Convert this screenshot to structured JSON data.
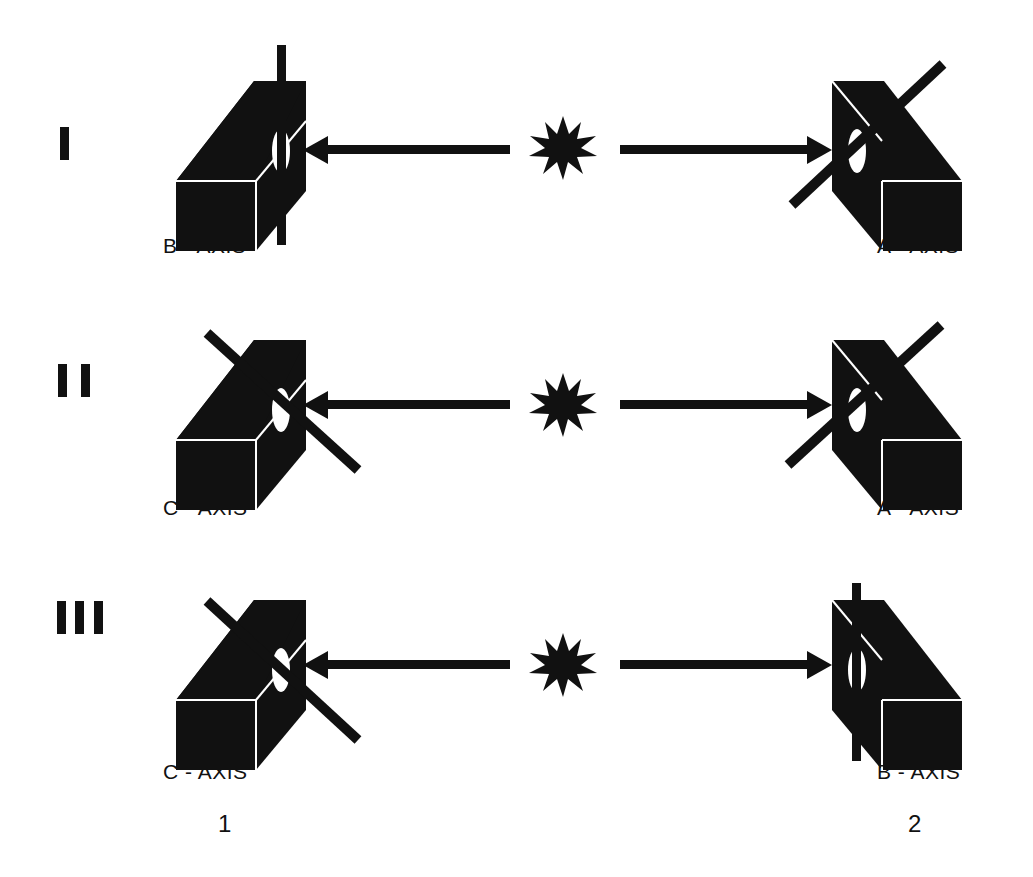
{
  "diagram": {
    "rows": [
      {
        "numeral": "I",
        "left_axis": "B - AXIS",
        "right_axis": "A - AXIS"
      },
      {
        "numeral": "II",
        "left_axis": "C - AXIS",
        "right_axis": "A - AXIS"
      },
      {
        "numeral": "III",
        "left_axis": "C - AXIS",
        "right_axis": "B - AXIS"
      }
    ],
    "columns": {
      "left": "1",
      "right": "2"
    },
    "colors": {
      "ink": "#111111",
      "background": "#ffffff"
    }
  }
}
